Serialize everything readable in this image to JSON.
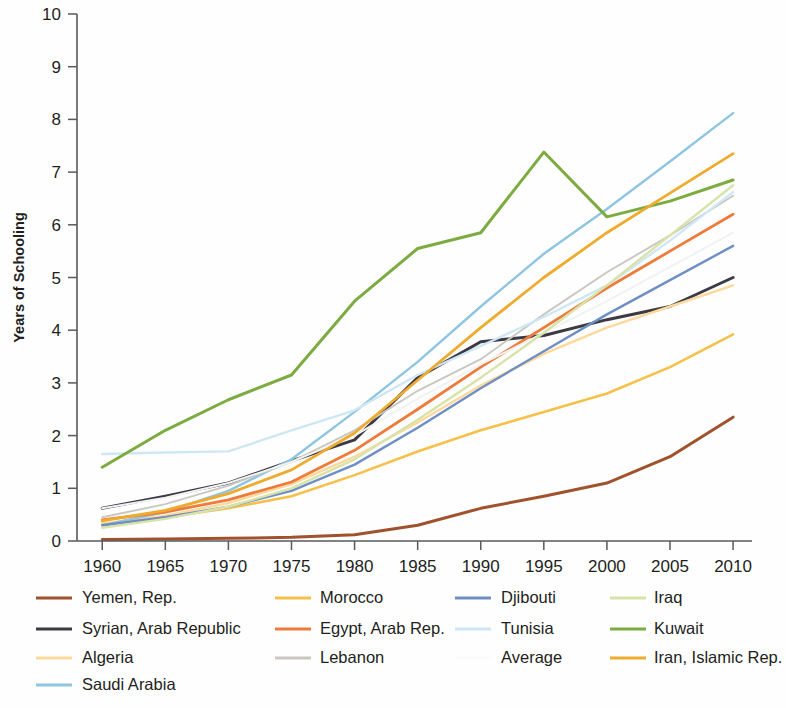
{
  "chart_data": {
    "type": "line",
    "title": "",
    "subtitle": "",
    "xlabel": "",
    "ylabel": "Years of Schooling",
    "x": [
      1960,
      1965,
      1970,
      1975,
      1980,
      1985,
      1990,
      1995,
      2000,
      2005,
      2010
    ],
    "xtick_labels": [
      "1960",
      "1965",
      "1970",
      "1975",
      "1980",
      "1985",
      "1990",
      "1995",
      "2000",
      "2005",
      "2010"
    ],
    "ytick_labels": [
      "0",
      "1",
      "2",
      "3",
      "4",
      "5",
      "6",
      "7",
      "8",
      "9",
      "10"
    ],
    "xlim": [
      1958,
      2011.5
    ],
    "ylim": [
      0,
      10
    ],
    "grid": false,
    "legend_position": "below-axes",
    "legend_columns": 4,
    "series": [
      {
        "name": "Yemen, Rep.",
        "color": "#a0522d",
        "width": 3.0,
        "values": [
          0.03,
          0.04,
          0.05,
          0.07,
          0.12,
          0.3,
          0.62,
          0.85,
          1.1,
          1.6,
          2.35
        ]
      },
      {
        "name": "Syrian, Arab Republic",
        "color": "#3b3a45",
        "width": 3.0,
        "values": [
          0.62,
          0.85,
          1.1,
          1.52,
          1.92,
          3.1,
          3.78,
          3.9,
          4.2,
          4.45,
          5.0
        ]
      },
      {
        "name": "Algeria",
        "color": "#ffd89b",
        "width": 2.4,
        "values": [
          0.33,
          0.48,
          0.72,
          1.08,
          1.6,
          2.25,
          2.95,
          3.55,
          4.05,
          4.45,
          4.85
        ]
      },
      {
        "name": "Saudi Arabia",
        "color": "#8ec5e0",
        "width": 2.4,
        "values": [
          0.3,
          0.55,
          0.95,
          1.55,
          2.45,
          3.4,
          4.45,
          5.45,
          6.3,
          7.2,
          8.12
        ]
      },
      {
        "name": "Morocco",
        "color": "#f5c14a",
        "width": 2.6,
        "values": [
          0.3,
          0.45,
          0.62,
          0.85,
          1.25,
          1.7,
          2.1,
          2.45,
          2.8,
          3.3,
          3.92
        ]
      },
      {
        "name": "Egypt, Arab Rep.",
        "color": "#ef7b3a",
        "width": 2.8,
        "values": [
          0.4,
          0.55,
          0.78,
          1.12,
          1.72,
          2.5,
          3.3,
          4.05,
          4.8,
          5.5,
          6.2
        ]
      },
      {
        "name": "Lebanon",
        "color": "#c9c7c0",
        "width": 1.9,
        "values": [
          0.45,
          0.7,
          1.05,
          1.5,
          2.1,
          2.85,
          3.45,
          4.3,
          5.1,
          5.8,
          6.55
        ]
      },
      {
        "name": "Djibouti",
        "color": "#6f8fc4",
        "width": 2.4,
        "values": [
          0.3,
          0.45,
          0.65,
          0.95,
          1.45,
          2.15,
          2.9,
          3.6,
          4.3,
          4.95,
          5.6
        ]
      },
      {
        "name": "Tunisia",
        "color": "#cfe7f5",
        "width": 2.4,
        "values": [
          1.65,
          1.68,
          1.7,
          2.1,
          2.48,
          3.15,
          3.7,
          4.25,
          4.85,
          5.7,
          6.62
        ]
      },
      {
        "name": "Average",
        "color": "#f2f2f2",
        "width": 2.0,
        "values": [
          0.62,
          0.82,
          1.1,
          1.5,
          2.0,
          2.7,
          3.35,
          3.95,
          4.55,
          5.2,
          5.85
        ]
      },
      {
        "name": "Iraq",
        "color": "#d7e3a8",
        "width": 2.4,
        "values": [
          0.25,
          0.42,
          0.65,
          1.0,
          1.55,
          2.3,
          3.1,
          3.95,
          4.85,
          5.8,
          6.75
        ]
      },
      {
        "name": "Kuwait",
        "color": "#7cab3f",
        "width": 3.0,
        "values": [
          1.4,
          2.1,
          2.68,
          3.15,
          4.55,
          5.55,
          5.85,
          7.38,
          6.15,
          6.45,
          6.85
        ]
      },
      {
        "name": "Iran, Islamic Rep.",
        "color": "#efab2e",
        "width": 2.8,
        "values": [
          0.38,
          0.58,
          0.9,
          1.35,
          2.05,
          3.05,
          4.05,
          5.0,
          5.85,
          6.6,
          7.35
        ]
      }
    ]
  },
  "legend": {
    "columns": [
      [
        {
          "label": "Yemen, Rep.",
          "color": "#a0522d",
          "width": 3.2
        },
        {
          "label": "Syrian, Arab Republic",
          "color": "#3b3a45",
          "width": 3.2
        },
        {
          "label": "Algeria",
          "color": "#ffd89b",
          "width": 2.8
        },
        {
          "label": "Saudi Arabia",
          "color": "#8ec5e0",
          "width": 2.8
        }
      ],
      [
        {
          "label": "Morocco",
          "color": "#f5c14a",
          "width": 3.0
        },
        {
          "label": "Egypt, Arab Rep.",
          "color": "#ef7b3a",
          "width": 3.0
        },
        {
          "label": "Lebanon",
          "color": "#c9c7c0",
          "width": 2.2
        }
      ],
      [
        {
          "label": "Djibouti",
          "color": "#6f8fc4",
          "width": 3.0
        },
        {
          "label": "Tunisia",
          "color": "#cfe7f5",
          "width": 3.0
        },
        {
          "label": "Average",
          "color": "#fbfbfb",
          "width": 2.4
        }
      ],
      [
        {
          "label": "Iraq",
          "color": "#d7e3a8",
          "width": 2.6
        },
        {
          "label": "Kuwait",
          "color": "#7cab3f",
          "width": 3.2
        },
        {
          "label": "Iran, Islamic Rep.",
          "color": "#efab2e",
          "width": 3.0
        }
      ]
    ]
  }
}
